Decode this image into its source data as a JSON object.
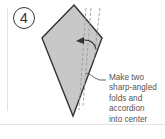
{
  "step": {
    "number": "4"
  },
  "caption": {
    "lines": [
      "Make two",
      "sharp-angled",
      "folds and",
      "accordion",
      "into center"
    ]
  },
  "colors": {
    "paper_fill": "#c8c8c8",
    "outline": "#333333",
    "fold_line": "#9a9a9a",
    "text": "#555555"
  },
  "icons": {
    "fold_arrow": "curved-arrow-left",
    "kite": "folded-paper-kite"
  }
}
